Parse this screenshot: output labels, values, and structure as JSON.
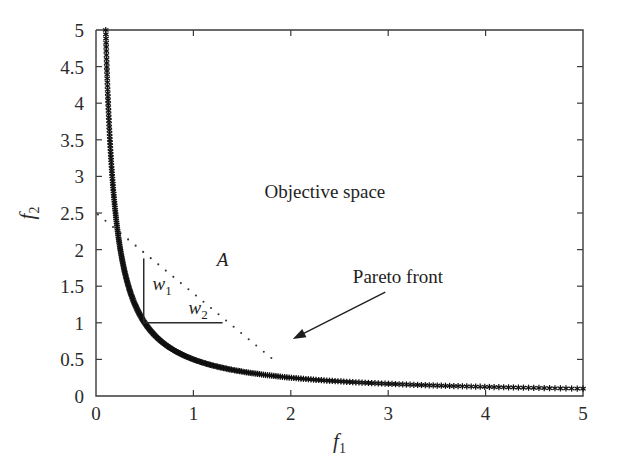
{
  "figure": {
    "background_color": "#ffffff",
    "axis_color": "#3a3a3a",
    "data_color": "#111111"
  },
  "axes": {
    "x_label": "f",
    "x_label_sub": "1",
    "y_label": "f",
    "y_label_sub": "2",
    "x_ticks": [
      "0",
      "1",
      "2",
      "3",
      "4",
      "5"
    ],
    "y_ticks": [
      "0",
      "0.5",
      "1",
      "1.5",
      "2",
      "2.5",
      "3",
      "3.5",
      "4",
      "4.5",
      "5"
    ]
  },
  "annotations": {
    "objective_space": "Objective space",
    "pareto_front": "Pareto front",
    "point_label": "A",
    "weight1": "w",
    "weight1_sub": "1",
    "weight2": "w",
    "weight2_sub": "2"
  },
  "chart_data": {
    "type": "scatter",
    "title": "",
    "xlabel": "f1",
    "ylabel": "f2",
    "xlim": [
      0,
      5
    ],
    "ylim": [
      0,
      5
    ],
    "xticks": [
      0,
      1,
      2,
      3,
      4,
      5
    ],
    "yticks": [
      0,
      0.5,
      1,
      1.5,
      2,
      2.5,
      3,
      3.5,
      4,
      4.5,
      5
    ],
    "grid": false,
    "legend": "none",
    "marker": "asterisk",
    "series": [
      {
        "name": "Pareto front",
        "relation": "f1 * f2 = 0.5",
        "x": [
          0.1,
          0.101,
          0.102,
          0.103,
          0.104,
          0.105,
          0.107,
          0.108,
          0.11,
          0.111,
          0.113,
          0.115,
          0.117,
          0.119,
          0.121,
          0.123,
          0.125,
          0.128,
          0.13,
          0.133,
          0.136,
          0.139,
          0.142,
          0.145,
          0.149,
          0.152,
          0.156,
          0.16,
          0.164,
          0.169,
          0.174,
          0.179,
          0.185,
          0.19,
          0.196,
          0.203,
          0.21,
          0.217,
          0.225,
          0.233,
          0.242,
          0.252,
          0.263,
          0.274,
          0.286,
          0.299,
          0.313,
          0.329,
          0.345,
          0.364,
          0.384,
          0.405,
          0.429,
          0.455,
          0.484,
          0.515,
          0.55,
          0.588,
          0.63,
          0.678,
          0.73,
          0.79,
          0.857,
          0.934,
          1.02,
          1.12,
          1.235,
          1.37,
          1.53,
          1.72,
          1.95,
          2.23,
          2.58,
          3.02,
          3.6,
          4.35,
          5.0
        ],
        "y": [
          5.0,
          4.95,
          4.9,
          4.85,
          4.8,
          4.75,
          4.7,
          4.65,
          4.6,
          4.55,
          4.45,
          4.35,
          4.27,
          4.2,
          4.13,
          4.06,
          4.0,
          3.9,
          3.85,
          3.76,
          3.68,
          3.6,
          3.52,
          3.45,
          3.36,
          3.29,
          3.21,
          3.13,
          3.05,
          2.96,
          2.87,
          2.79,
          2.7,
          2.63,
          2.55,
          2.46,
          2.38,
          2.3,
          2.22,
          2.15,
          2.07,
          1.98,
          1.9,
          1.825,
          1.75,
          1.67,
          1.6,
          1.52,
          1.45,
          1.37,
          1.3,
          1.235,
          1.165,
          1.1,
          1.035,
          0.97,
          0.91,
          0.85,
          0.795,
          0.737,
          0.685,
          0.633,
          0.583,
          0.535,
          0.49,
          0.446,
          0.405,
          0.365,
          0.327,
          0.291,
          0.256,
          0.224,
          0.194,
          0.166,
          0.139,
          0.115,
          0.1
        ]
      },
      {
        "name": "Tangent line (dotted)",
        "style": "dotted",
        "x": [
          0.02,
          1.8
        ],
        "y": [
          2.48,
          0.52
        ]
      }
    ],
    "annotations": [
      {
        "text": "Objective space",
        "x": 2.35,
        "y": 2.7
      },
      {
        "text": "Pareto front",
        "x": 3.1,
        "y": 1.55
      },
      {
        "text": "A",
        "x": 1.3,
        "y": 1.78
      },
      {
        "text": "w1",
        "x": 0.58,
        "y": 1.45
      },
      {
        "text": "w2",
        "x": 0.95,
        "y": 1.12
      }
    ],
    "arrow": {
      "from_x": 2.97,
      "from_y": 1.42,
      "to_x": 2.02,
      "to_y": 0.78
    },
    "weight_corner": {
      "vertical_x": 0.49,
      "vertical_y_top": 1.88,
      "vertical_y_bottom": 1.0,
      "horizontal_y": 1.0,
      "horizontal_x_left": 0.49,
      "horizontal_x_right": 1.3
    }
  }
}
